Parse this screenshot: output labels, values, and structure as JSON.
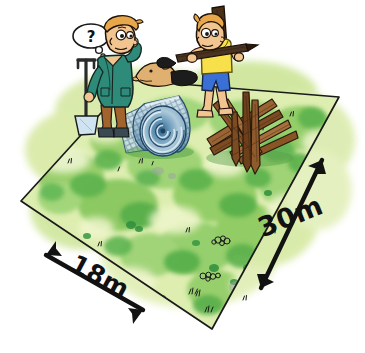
{
  "illustration": {
    "title": "Cartoon of two boys measuring a rectangular grass plot",
    "scene_type": "hand-drawn ink-and-watercolour cartoon",
    "background_color": "#ffffff"
  },
  "measurements": [
    {
      "id": "width-measure",
      "label": "18m",
      "value": 18,
      "unit": "m",
      "edge": "front-left edge",
      "arrow_style": "double-headed",
      "arrow_direction": "up-left and down-right"
    },
    {
      "id": "length-measure",
      "label": "30m",
      "value": 30,
      "unit": "m",
      "edge": "right edge",
      "arrow_style": "double-headed",
      "arrow_direction": "up-right and down-left"
    }
  ],
  "plot": {
    "name": "grass-plot",
    "shape": "quadrilateral (rectangle in perspective)",
    "corners": [
      {
        "name": "left",
        "x": 21,
        "y": 201
      },
      {
        "name": "top",
        "x": 131,
        "y": 80
      },
      {
        "name": "right",
        "x": 339,
        "y": 97
      },
      {
        "name": "bottom",
        "x": 212,
        "y": 329
      }
    ],
    "grass_colors": {
      "pale": "#e8f2c4",
      "light": "#cbe49a",
      "mid": "#8fcc62",
      "deep": "#58b04a",
      "dark": "#2f8f3c"
    },
    "outline_color": "#1a1a1a"
  },
  "characters": [
    {
      "id": "boy-with-spade",
      "name": "boy-with-spade",
      "position": "left",
      "hair_color": "#e8a84a",
      "skin_color": "#f2c48f",
      "jacket_color": "#2e8b7a",
      "shorts_color": "#a2632c",
      "boots_color": "#3a4a52",
      "pose": "standing, scratching head, holding a spade",
      "thought_bubble": {
        "text": "?",
        "name": "thought-bubble"
      },
      "tool": {
        "name": "spade",
        "handle_color": "#2a2a2a",
        "blade_color": "#cfe4f0"
      }
    },
    {
      "id": "boy-with-plank",
      "name": "boy-with-plank",
      "position": "right",
      "hair_color": "#e8a84a",
      "skin_color": "#f2c48f",
      "shirt_color": "#f7e04a",
      "shorts_color": "#3a6fd6",
      "pose": "walking, carrying a long wooden plank on the shoulder",
      "carried_item": {
        "name": "wooden-plank",
        "color": "#4a3320"
      },
      "background_post": {
        "name": "upright-post",
        "color": "#4a2f18"
      }
    }
  ],
  "objects": [
    {
      "id": "wire-mesh-roll",
      "name": "wire-mesh-roll",
      "description": "rolled-up chain-link wire fencing",
      "colors": {
        "light": "#cfe0ea",
        "mid": "#8fb4c8",
        "dark": "#3f6f92"
      }
    },
    {
      "id": "timber-pile",
      "name": "timber-pile",
      "description": "pile of brown wooden fence posts and stakes",
      "colors": {
        "light": "#a9703f",
        "mid": "#8a5224",
        "dark": "#5a3416"
      }
    },
    {
      "id": "dog",
      "name": "dog",
      "description": "small dog head with dark muzzle peeking up",
      "colors": {
        "body": "#e0b070",
        "muzzle": "#1a1a1a"
      }
    }
  ],
  "ground_details": {
    "name": "grass-tufts-and-pebbles",
    "description": "small ink-sketched weeds, pebbles and grass tufts scattered on the plot",
    "ink_color": "#1a1a1a"
  }
}
